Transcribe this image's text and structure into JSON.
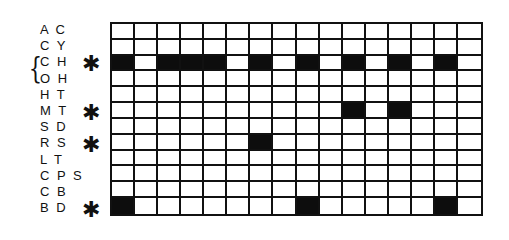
{
  "diagram": {
    "columns": 16,
    "rows": [
      {
        "code": "A C",
        "marked": false,
        "filled_columns": []
      },
      {
        "code": "C Y",
        "marked": false,
        "filled_columns": []
      },
      {
        "code": "C H",
        "marked": true,
        "filled_columns": [
          1,
          3,
          4,
          5,
          7,
          9,
          11,
          13,
          15
        ]
      },
      {
        "code": "O H",
        "marked": false,
        "filled_columns": []
      },
      {
        "code": "H T",
        "marked": false,
        "filled_columns": []
      },
      {
        "code": "M T",
        "marked": true,
        "filled_columns": [
          11,
          13
        ]
      },
      {
        "code": "S D",
        "marked": false,
        "filled_columns": []
      },
      {
        "code": "R S",
        "marked": true,
        "filled_columns": [
          7
        ]
      },
      {
        "code": "L T",
        "marked": false,
        "filled_columns": []
      },
      {
        "code": "C P S",
        "marked": false,
        "filled_columns": []
      },
      {
        "code": "C B",
        "marked": false,
        "filled_columns": []
      },
      {
        "code": "B D",
        "marked": true,
        "filled_columns": [
          1,
          9,
          15
        ]
      }
    ],
    "brace_groups": [
      [
        "C H",
        "O H"
      ]
    ],
    "marker_symbol": "✱",
    "brace_symbol": "{",
    "fill_color": "#0d0d0d",
    "empty_color": "#ffffff"
  }
}
